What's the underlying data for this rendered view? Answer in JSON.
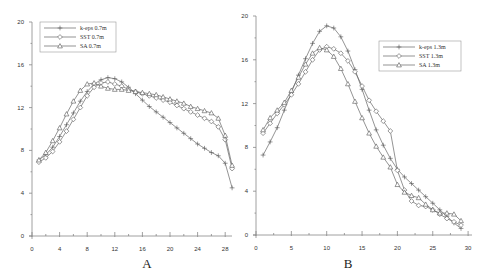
{
  "chart_data": [
    {
      "type": "line",
      "panel_label": "A",
      "title": "",
      "xlabel": "",
      "ylabel": "",
      "xlim": [
        0,
        29
      ],
      "ylim": [
        0,
        20
      ],
      "xticks": [
        0,
        4,
        8,
        12,
        16,
        20,
        24,
        28
      ],
      "yticks": [
        0,
        4,
        8,
        12,
        16,
        20
      ],
      "grid": false,
      "legend_position": "upper-left",
      "x": [
        1,
        2,
        3,
        4,
        5,
        6,
        7,
        8,
        9,
        10,
        11,
        12,
        13,
        14,
        15,
        16,
        17,
        18,
        19,
        20,
        21,
        22,
        23,
        24,
        25,
        26,
        27,
        28,
        29
      ],
      "series": [
        {
          "name": "k-eps 0.7m",
          "marker": "cross",
          "values": [
            7.1,
            7.6,
            8.3,
            9.3,
            10.4,
            11.5,
            12.6,
            13.5,
            14.2,
            14.6,
            14.8,
            14.7,
            14.4,
            13.9,
            13.3,
            12.7,
            12.1,
            11.6,
            11.1,
            10.6,
            10.1,
            9.6,
            9.1,
            8.6,
            8.2,
            7.8,
            7.5,
            6.8,
            4.5
          ]
        },
        {
          "name": "SST 0.7m",
          "marker": "diamond",
          "values": [
            6.9,
            7.3,
            7.9,
            8.8,
            9.8,
            10.9,
            12.0,
            13.1,
            13.9,
            14.3,
            14.4,
            14.2,
            14.0,
            13.7,
            13.5,
            13.3,
            13.1,
            12.9,
            12.7,
            12.5,
            12.2,
            11.9,
            11.6,
            11.3,
            11.0,
            10.7,
            10.2,
            9.0,
            6.3
          ]
        },
        {
          "name": "SA 0.7m",
          "marker": "triangle",
          "values": [
            7.1,
            7.8,
            8.9,
            10.1,
            11.4,
            12.6,
            13.6,
            14.2,
            14.3,
            14.0,
            13.8,
            13.7,
            13.7,
            13.6,
            13.5,
            13.4,
            13.3,
            13.2,
            13.0,
            12.8,
            12.6,
            12.4,
            12.1,
            11.9,
            11.7,
            11.5,
            11.0,
            9.4,
            6.6
          ]
        }
      ]
    },
    {
      "type": "line",
      "panel_label": "B",
      "title": "",
      "xlabel": "",
      "ylabel": "",
      "xlim": [
        0,
        30
      ],
      "ylim": [
        0,
        20
      ],
      "xticks": [
        0,
        5,
        10,
        15,
        20,
        25,
        30
      ],
      "yticks": [
        0,
        4,
        8,
        12,
        16,
        20
      ],
      "grid": false,
      "legend_position": "upper-right",
      "x": [
        1,
        2,
        3,
        4,
        5,
        6,
        7,
        8,
        9,
        10,
        11,
        12,
        13,
        14,
        15,
        16,
        17,
        18,
        19,
        20,
        21,
        22,
        23,
        24,
        25,
        26,
        27,
        28,
        29
      ],
      "series": [
        {
          "name": "k-eps 1.3m",
          "marker": "cross",
          "values": [
            7.3,
            8.5,
            9.8,
            11.4,
            13.0,
            14.6,
            16.1,
            17.5,
            18.6,
            19.1,
            18.9,
            18.1,
            16.8,
            15.1,
            13.3,
            11.4,
            9.6,
            8.2,
            7.0,
            6.0,
            5.3,
            4.7,
            4.1,
            3.5,
            2.9,
            2.3,
            1.7,
            1.1,
            0.6
          ]
        },
        {
          "name": "SST 1.3m",
          "marker": "diamond",
          "values": [
            9.3,
            10.2,
            11.1,
            11.9,
            12.8,
            13.8,
            14.9,
            16.0,
            16.9,
            17.2,
            17.0,
            16.6,
            15.9,
            14.9,
            13.6,
            12.3,
            11.3,
            10.4,
            9.5,
            5.9,
            4.1,
            3.1,
            2.7,
            2.6,
            2.3,
            1.9,
            1.5,
            1.2,
            0.9
          ]
        },
        {
          "name": "SA 1.3m",
          "marker": "triangle",
          "values": [
            9.6,
            10.7,
            11.4,
            12.1,
            13.2,
            14.4,
            15.6,
            16.6,
            17.1,
            16.9,
            16.3,
            15.2,
            13.8,
            12.2,
            10.7,
            9.3,
            8.1,
            7.1,
            6.2,
            4.6,
            3.9,
            3.6,
            3.4,
            2.8,
            2.3,
            2.0,
            2.0,
            1.9,
            1.3
          ]
        }
      ]
    }
  ]
}
